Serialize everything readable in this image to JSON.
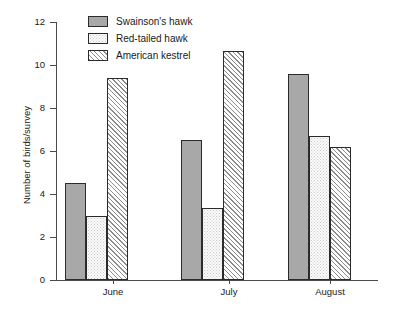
{
  "chart_data": {
    "type": "bar",
    "title": "",
    "subtitle": "",
    "xlabel": "",
    "ylabel": "Number of birds/survey",
    "categories": [
      "June",
      "July",
      "August"
    ],
    "ylim": [
      0,
      12
    ],
    "y_ticks": [
      0,
      2,
      4,
      6,
      8,
      10,
      12
    ],
    "y_tick_labels": [
      "0",
      "2",
      "4",
      "6",
      "8",
      "10",
      "12"
    ],
    "grid": false,
    "legend_position": "top-center",
    "series": [
      {
        "name": "Swainson's hawk",
        "fill": "solid",
        "color": "#a8a8a8",
        "values": [
          4.5,
          6.5,
          9.6
        ]
      },
      {
        "name": "Red-tailed hawk",
        "fill": "dots",
        "color": "#fbfbfb",
        "values": [
          3.0,
          3.35,
          6.7
        ]
      },
      {
        "name": "American kestrel",
        "fill": "hatch",
        "color": "#ffffff",
        "values": [
          9.4,
          10.65,
          6.2
        ]
      }
    ]
  },
  "legend": {
    "items": [
      {
        "label": "Swainson's hawk"
      },
      {
        "label": "Red-tailed hawk"
      },
      {
        "label": "American kestrel"
      }
    ]
  },
  "axes": {
    "y_title": "Number of birds/survey",
    "y_labels": [
      "12",
      "10",
      "8",
      "6",
      "4",
      "2",
      "0"
    ],
    "x_labels": [
      "June",
      "July",
      "August"
    ]
  }
}
